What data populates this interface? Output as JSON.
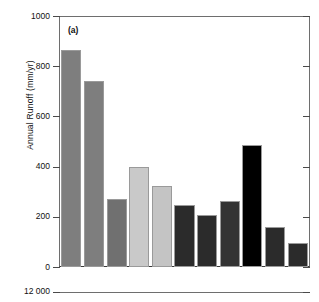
{
  "figure": {
    "panel_letter": "(a)",
    "axis_color": "#4a4a4a"
  },
  "chart_data": {
    "type": "bar",
    "title": "",
    "subtitle": "",
    "panel": "(a)",
    "xlabel": "",
    "ylabel": "Annual Runoff (mm/yr)",
    "ylim": [
      0,
      1000
    ],
    "yticks": [
      0,
      200,
      400,
      600,
      800,
      1000
    ],
    "ytick_labels": [
      "0",
      "200",
      "400",
      "600",
      "800",
      "1000"
    ],
    "grid": false,
    "legend": "none",
    "categories": [
      "1",
      "2",
      "3",
      "4",
      "5",
      "6",
      "7",
      "8",
      "9",
      "10",
      "11"
    ],
    "values": [
      864,
      740,
      272,
      400,
      324,
      248,
      208,
      264,
      488,
      160,
      96
    ],
    "bar_colors": [
      "#7e7e7e",
      "#7e7e7e",
      "#707070",
      "#c9c9c9",
      "#c4c4c4",
      "#2b2b2b",
      "#2b2b2b",
      "#333333",
      "#000000",
      "#2b2b2b",
      "#2b2b2b"
    ]
  },
  "lower_panel": {
    "tick_label": "12 000"
  }
}
